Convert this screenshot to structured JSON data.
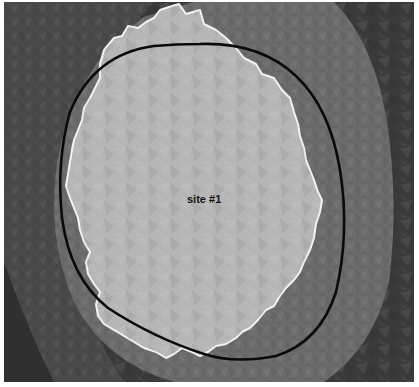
{
  "map": {
    "site_label": "site #1",
    "layers": [
      {
        "name": "outer-terrain",
        "color": "#3a3a3a"
      },
      {
        "name": "buffer-zone",
        "color": "#6e6e6e"
      },
      {
        "name": "site-area",
        "color": "#b4b4b4"
      },
      {
        "name": "site-outline",
        "color": "#f2f2f2"
      },
      {
        "name": "boundary-ellipse",
        "color": "#0a0a0a"
      }
    ]
  }
}
